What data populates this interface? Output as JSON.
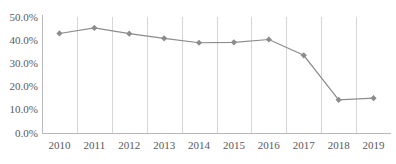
{
  "chart_data": {
    "type": "line",
    "title": "",
    "title_note": "chart title is cropped off the top edge of the screenshot and is illegible",
    "xlabel": "",
    "ylabel": "",
    "categories": [
      "2010",
      "2011",
      "2012",
      "2013",
      "2014",
      "2015",
      "2016",
      "2017",
      "2018",
      "2019"
    ],
    "values": [
      42.9,
      45.3,
      42.8,
      40.8,
      38.9,
      39.1,
      40.3,
      33.5,
      14.3,
      15.0
    ],
    "series": [
      {
        "name": "",
        "values": [
          42.9,
          45.3,
          42.8,
          40.8,
          38.9,
          39.1,
          40.3,
          33.5,
          14.3,
          15.0
        ]
      }
    ],
    "ylim": [
      0,
      50
    ],
    "ytick_values": [
      0,
      10,
      20,
      30,
      40,
      50
    ],
    "ytick_labels": [
      "0.0%",
      "10.0%",
      "20.0%",
      "30.0%",
      "40.0%",
      "50.0%"
    ],
    "xtick_labels": [
      "2010",
      "2011",
      "2012",
      "2013",
      "2014",
      "2015",
      "2016",
      "2017",
      "2018",
      "2019"
    ],
    "grid": {
      "vertical": true,
      "horizontal": false
    },
    "legend": {
      "visible": false,
      "position": "none"
    },
    "marker": "diamond",
    "colors": {
      "series_line": "#8c8c8c",
      "marker": "#8c8c8c",
      "gridline": "#d6d6da",
      "axis": "#b9b9bd",
      "tick_text": "#58585c",
      "background": "#ffffff"
    }
  }
}
